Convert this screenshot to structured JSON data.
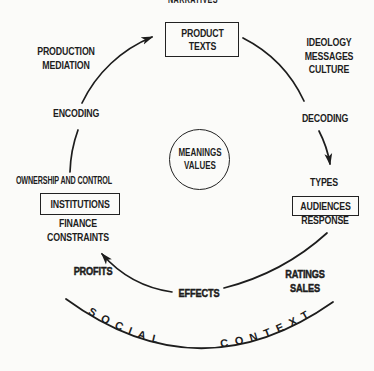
{
  "diagram": {
    "top_clipped_label": "NARRATIVES",
    "cycle": {
      "product_texts": "PRODUCT\nTEXTS",
      "ideology_messages_culture": "IDEOLOGY\nMESSAGES\nCULTURE",
      "decoding": "DECODING",
      "types": "TYPES",
      "audiences": "AUDIENCES",
      "response": "RESPONSE",
      "ratings_sales": "RATINGS\nSALES",
      "effects": "EFFECTS",
      "profits": "PROFITS",
      "finance_constraints": "FINANCE\nCONSTRAINTS",
      "institutions": "INSTITUTIONS",
      "ownership_and_control": "OWNERSHIP AND CONTROL",
      "encoding": "ENCODING",
      "production_mediation": "PRODUCTION\nMEDIATION"
    },
    "center_label": "MEANINGS\nVALUES",
    "context_arc": {
      "left_word": "SOCIAL",
      "right_word": "CONTEXT"
    },
    "colors": {
      "ink": "#1d1d1d",
      "background": "#fbfbf9"
    }
  }
}
